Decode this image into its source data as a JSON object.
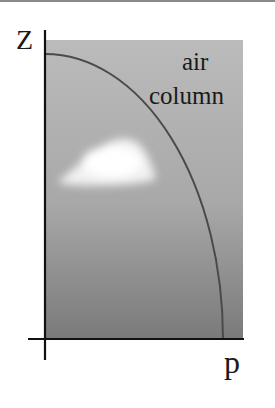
{
  "diagram": {
    "axes": {
      "y_label": "Z",
      "x_label": "p"
    },
    "region_label": {
      "line1": "air",
      "line2": "column"
    },
    "elements": {
      "air_column": "gray gradient rectangle representing an air column",
      "pressure_curve": "curve showing pressure decreasing with height",
      "cloud": "white cloud inside the air column"
    },
    "colors": {
      "column_top": "#bababa",
      "column_bottom": "#7a7a7a",
      "curve": "#4a4a4a",
      "axis": "#111111",
      "cloud": "#ffffff"
    }
  }
}
